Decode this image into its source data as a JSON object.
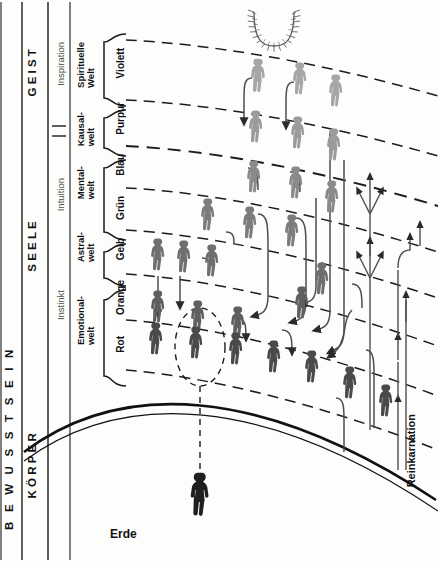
{
  "diagram": {
    "title_axis": "B E W U S S T S E I N",
    "axis_letters": [
      "B",
      "E",
      "W",
      "U",
      "S",
      "S",
      "T",
      "S",
      "E",
      "I",
      "N"
    ],
    "earth_label": "Erde",
    "reincarnation_label": "Reinkarnation",
    "planes": [
      {
        "name": "KÖRPER",
        "sense": "",
        "world": "",
        "band_top": 392,
        "band_bottom": 562
      },
      {
        "name": "SEELE",
        "sense": "Instinkt",
        "world": "",
        "band_top": 200,
        "band_bottom": 392
      },
      {
        "name": "GEIST",
        "sense": "Inspiration",
        "world": "",
        "band_top": 10,
        "band_bottom": 118
      }
    ],
    "columns": {
      "consciousness": {
        "label": "B E W U S S T S E I N"
      },
      "triad": [
        {
          "label": "KÖRPER",
          "top": 392,
          "bottom": 560
        },
        {
          "label": "SEELE",
          "top": 176,
          "bottom": 392
        },
        {
          "label": "GEIST",
          "top": 14,
          "bottom": 134
        }
      ],
      "senses": [
        {
          "label": "Instinkt",
          "top": 272,
          "bottom": 392
        },
        {
          "label": "Intuition",
          "top": 150,
          "bottom": 272
        },
        {
          "label": "Inspiration",
          "top": 22,
          "bottom": 132
        }
      ],
      "worlds": [
        {
          "label": "Emotional-\nwelt",
          "top": 278,
          "bottom": 386
        },
        {
          "label": "Astral-\nwelt",
          "top": 228,
          "bottom": 278
        },
        {
          "label": "Mental-\nwelt",
          "top": 158,
          "bottom": 228
        },
        {
          "label": "Kausal-\nwelt",
          "top": 108,
          "bottom": 158
        },
        {
          "label": "Spirituelle\nWelt",
          "top": 30,
          "bottom": 108
        }
      ],
      "colors": [
        {
          "label": "Rot",
          "top": 320,
          "bottom": 385
        },
        {
          "label": "Orange",
          "top": 274,
          "bottom": 320
        },
        {
          "label": "Gelb",
          "top": 230,
          "bottom": 274
        },
        {
          "label": "Grün",
          "top": 188,
          "bottom": 230
        },
        {
          "label": "Blau",
          "top": 146,
          "bottom": 188
        },
        {
          "label": "Purpur",
          "top": 100,
          "bottom": 146
        },
        {
          "label": "Violett",
          "top": 38,
          "bottom": 100
        }
      ]
    },
    "icons": {
      "sun": "radiant-sun-icon",
      "figure": "human-figure-icon",
      "earth_curve": "earth-horizon-arc"
    },
    "palette": {
      "ink": "#141414",
      "figure_dark": "#3b3b3b",
      "figure_mid": "#6a6a6a",
      "figure_light": "#9a9a9a",
      "line": "#5a5a5a",
      "background": "#fdfdfc"
    }
  }
}
